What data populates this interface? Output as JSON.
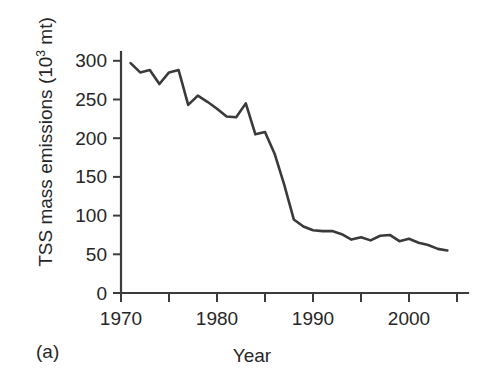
{
  "figure": {
    "panel_label": "(a)",
    "line_color": "#3a3a3a",
    "axis_color": "#3c3c3c",
    "background_color": "#ffffff"
  },
  "chart_data": {
    "type": "line",
    "title": "",
    "xlabel": "Year",
    "ylabel": "TSS mass emissions (10",
    "ylabel_superscript": "3",
    "ylabel_suffix": " mt)",
    "ylabel_full": "TSS mass emissions (10^3 mt)",
    "xlim": [
      1970,
      2005
    ],
    "ylim": [
      0,
      315
    ],
    "yticks": [
      0,
      50,
      100,
      150,
      200,
      250,
      300
    ],
    "ytick_labels": [
      "0",
      "50",
      "100",
      "150",
      "200",
      "250",
      "300"
    ],
    "xticks": [
      1970,
      1975,
      1980,
      1985,
      1990,
      1995,
      2000,
      2005
    ],
    "xtick_labels": [
      "1970",
      "",
      "1980",
      "",
      "1990",
      "",
      "2000",
      ""
    ],
    "xtick_labeled": [
      1970,
      1980,
      1990,
      2000
    ],
    "grid": false,
    "legend": null,
    "units": "10^3 metric tons",
    "series": [
      {
        "name": "TSS mass emissions",
        "x": [
          1971,
          1972,
          1973,
          1974,
          1975,
          1976,
          1977,
          1978,
          1979,
          1980,
          1981,
          1982,
          1983,
          1984,
          1985,
          1986,
          1987,
          1988,
          1989,
          1990,
          1991,
          1992,
          1993,
          1994,
          1995,
          1996,
          1997,
          1998,
          1999,
          2000,
          2001,
          2002,
          2003,
          2004
        ],
        "values": [
          297,
          285,
          288,
          270,
          285,
          288,
          243,
          255,
          247,
          238,
          228,
          227,
          245,
          205,
          208,
          180,
          140,
          95,
          86,
          81,
          80,
          80,
          76,
          69,
          72,
          68,
          74,
          75,
          67,
          70,
          65,
          62,
          57,
          55
        ]
      }
    ]
  }
}
